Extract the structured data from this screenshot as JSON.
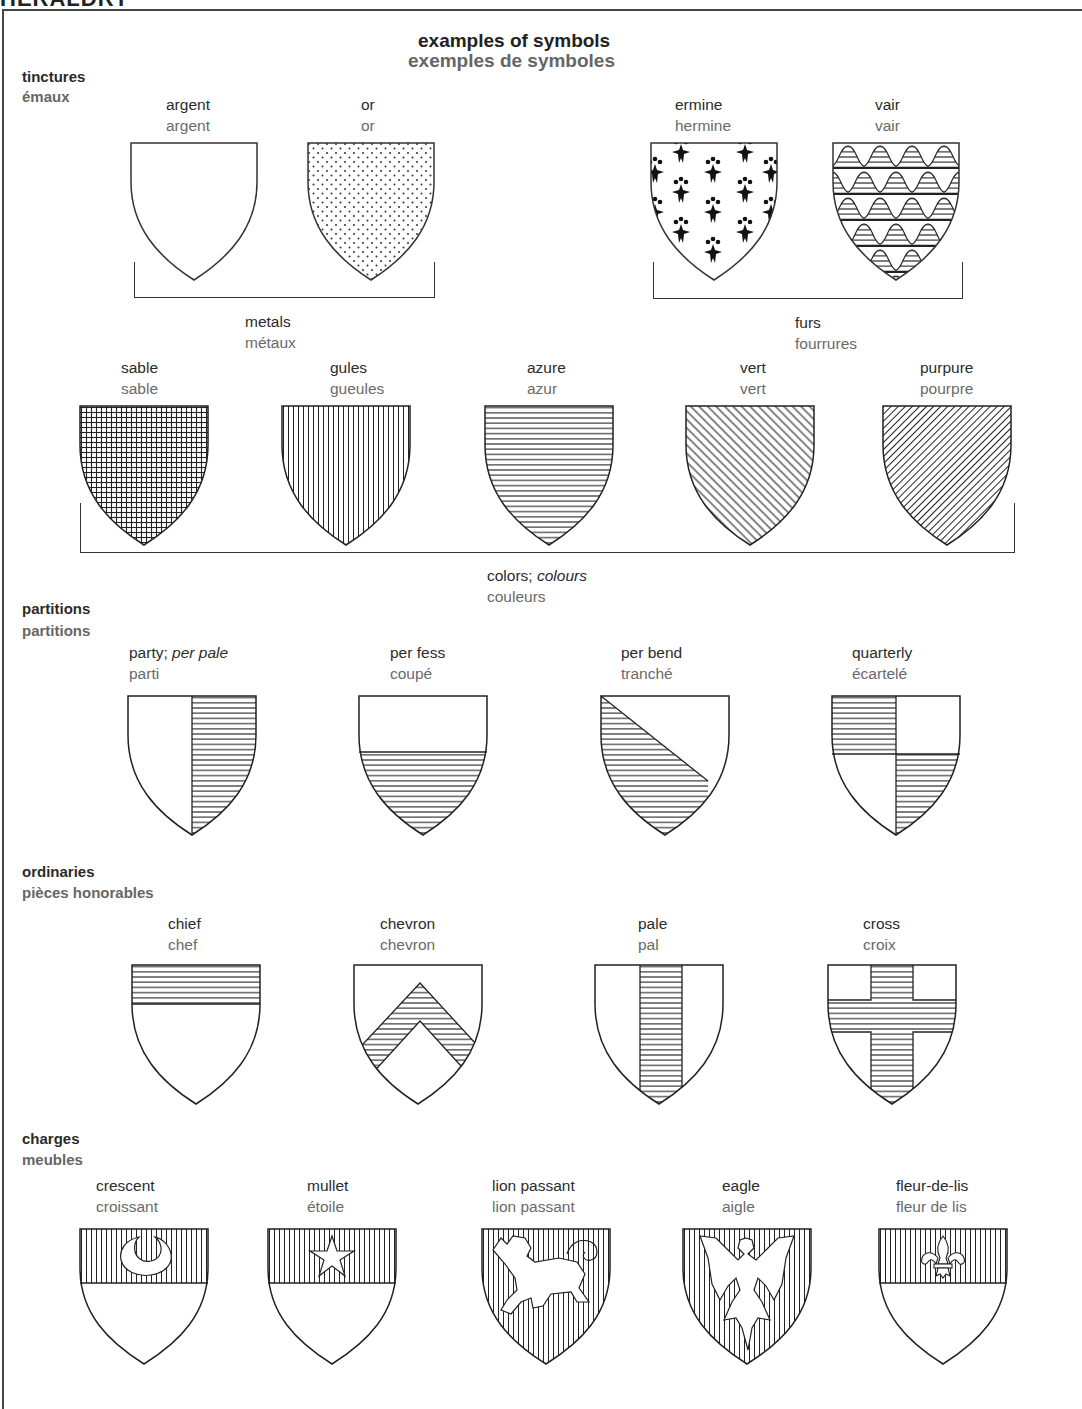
{
  "page": {
    "cut_header": "HERALDRY",
    "title_en": "examples of symbols",
    "title_fr": "exemples de symboles"
  },
  "sections": {
    "tinctures": {
      "en": "tinctures",
      "fr": "émaux"
    },
    "partitions": {
      "en": "partitions",
      "fr": "partitions"
    },
    "ordinaries": {
      "en": "ordinaries",
      "fr": "pièces honorables"
    },
    "charges": {
      "en": "charges",
      "fr": "meubles"
    }
  },
  "groups": {
    "metals": {
      "en": "metals",
      "fr": "métaux"
    },
    "furs": {
      "en": "furs",
      "fr": "fourrures"
    },
    "colors": {
      "en": "colors;",
      "en_alt": "colours",
      "fr": "couleurs"
    }
  },
  "metals": [
    {
      "en": "argent",
      "fr": "argent",
      "pattern": "plain"
    },
    {
      "en": "or",
      "fr": "or",
      "pattern": "dots"
    }
  ],
  "furs": [
    {
      "en": "ermine",
      "fr": "hermine",
      "pattern": "ermine"
    },
    {
      "en": "vair",
      "fr": "vair",
      "pattern": "vair"
    }
  ],
  "colors": [
    {
      "en": "sable",
      "fr": "sable",
      "pattern": "grid"
    },
    {
      "en": "gules",
      "fr": "gueules",
      "pattern": "vertical"
    },
    {
      "en": "azure",
      "fr": "azur",
      "pattern": "horizontal"
    },
    {
      "en": "vert",
      "fr": "vert",
      "pattern": "diagonal-down"
    },
    {
      "en": "purpure",
      "fr": "pourpre",
      "pattern": "diagonal-up"
    }
  ],
  "partitions": [
    {
      "en": "party;",
      "en_alt": "per pale",
      "fr": "parti"
    },
    {
      "en": "per fess",
      "fr": "coupé"
    },
    {
      "en": "per bend",
      "fr": "tranché"
    },
    {
      "en": "quarterly",
      "fr": "écartelé"
    }
  ],
  "ordinaries": [
    {
      "en": "chief",
      "fr": "chef"
    },
    {
      "en": "chevron",
      "fr": "chevron"
    },
    {
      "en": "pale",
      "fr": "pal"
    },
    {
      "en": "cross",
      "fr": "croix"
    }
  ],
  "charges": [
    {
      "en": "crescent",
      "fr": "croissant"
    },
    {
      "en": "mullet",
      "fr": "étoile"
    },
    {
      "en": "lion passant",
      "fr": "lion passant"
    },
    {
      "en": "eagle",
      "fr": "aigle"
    },
    {
      "en": "fleur-de-lis",
      "fr": "fleur de lis"
    }
  ]
}
